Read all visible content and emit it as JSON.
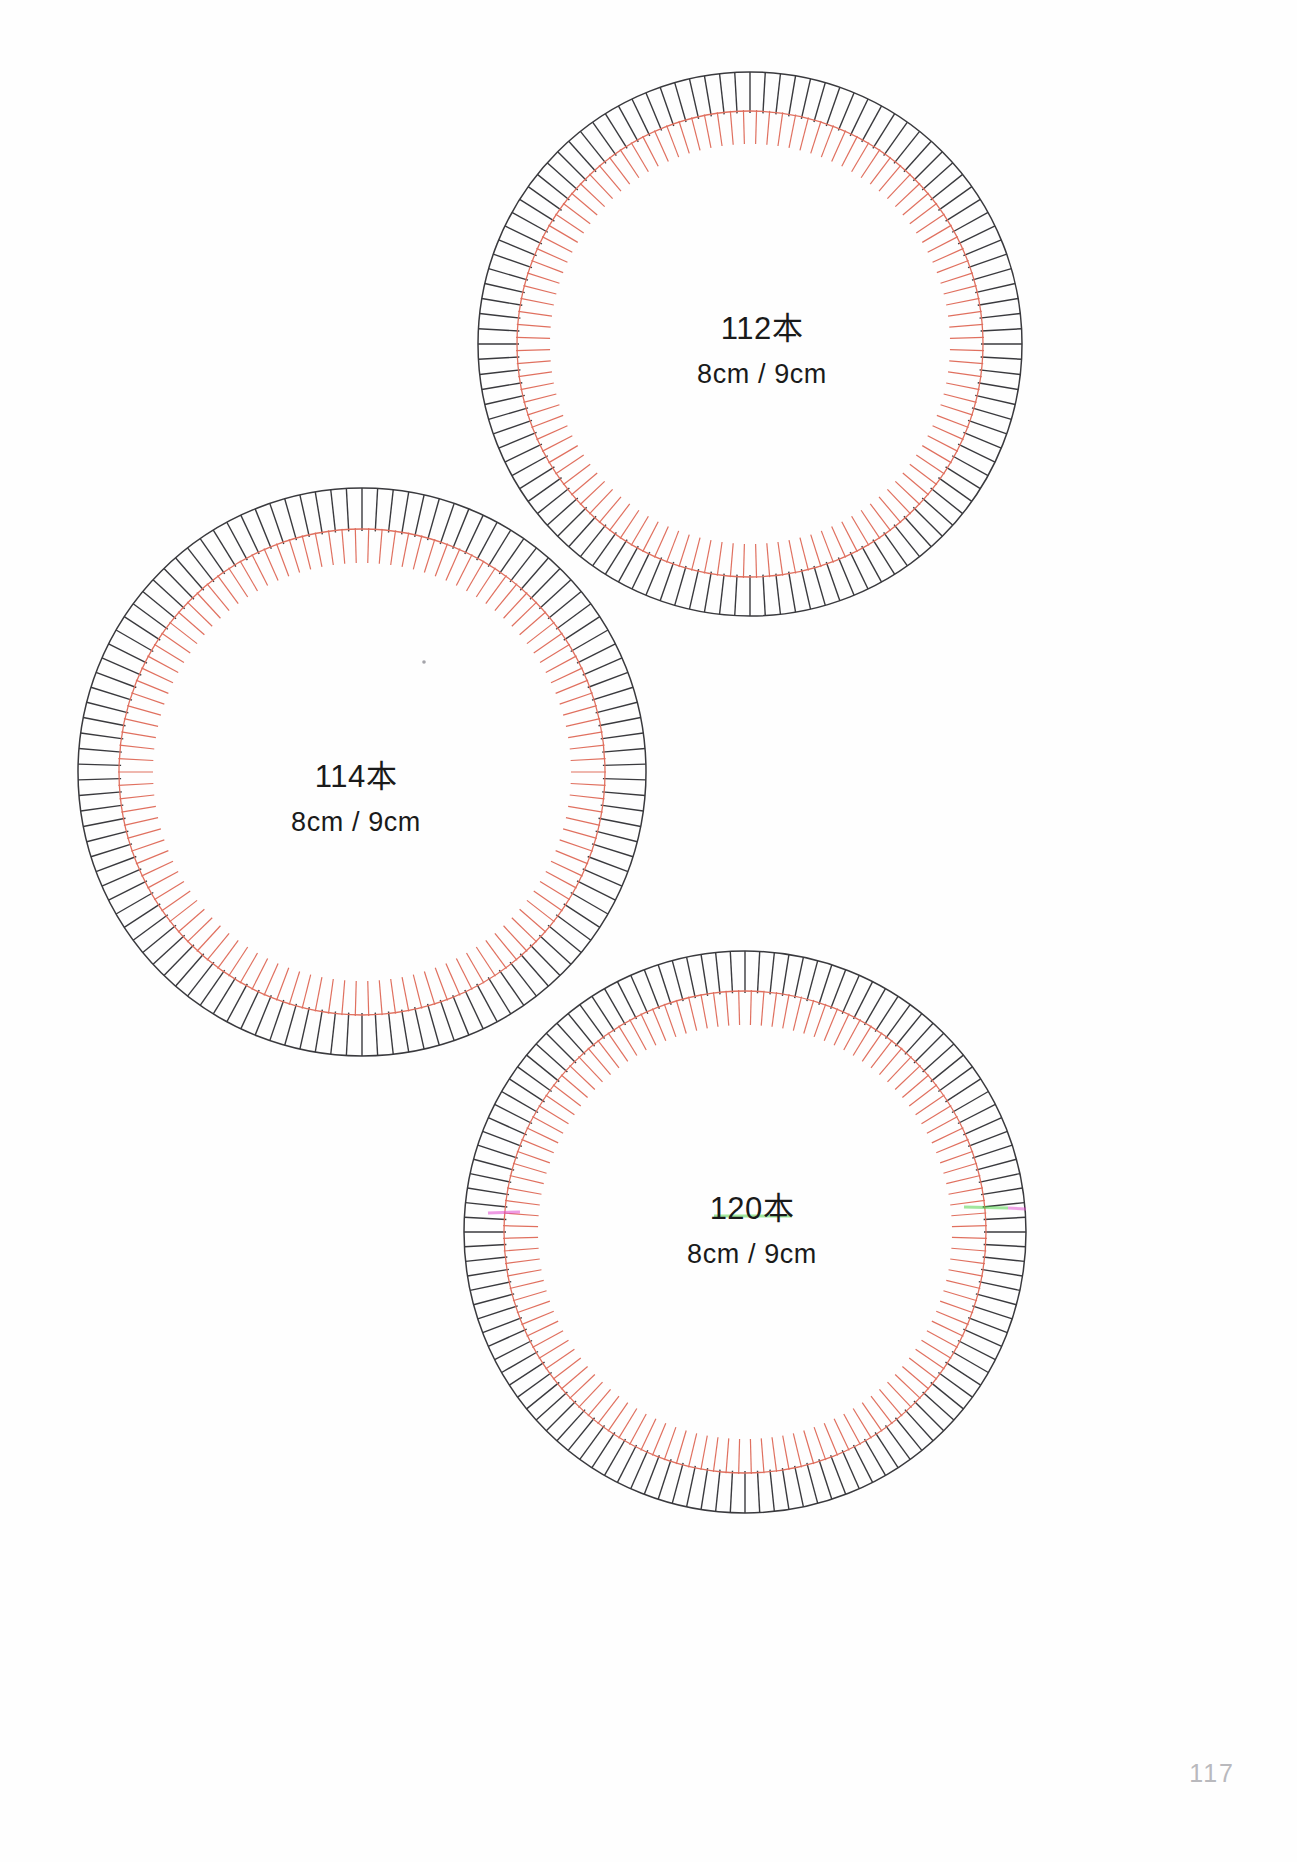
{
  "page": {
    "background_color": "#ffffff",
    "page_number": "117",
    "width": 1297,
    "height": 1862
  },
  "colors": {
    "outer_ring": "#3a3a3e",
    "inner_ring": "#e0705f",
    "text": "#1a1a1a",
    "page_number": "#b9b9bd",
    "artifact_magenta": "#e24bd0",
    "artifact_green": "#46d13f"
  },
  "wheels": [
    {
      "id": "wheel-112",
      "count_label": "112本",
      "size_label": "8cm / 9cm",
      "teeth": 112,
      "center_x": 750,
      "center_y": 344,
      "outer_radius": 272,
      "inner_radius": 233,
      "tick_inner_radius": 200,
      "label_x": 762,
      "label_y": 308,
      "artifacts": []
    },
    {
      "id": "wheel-114",
      "count_label": "114本",
      "size_label": "8cm / 9cm",
      "teeth": 114,
      "center_x": 362,
      "center_y": 772,
      "outer_radius": 284,
      "inner_radius": 243,
      "tick_inner_radius": 209,
      "label_x": 356,
      "label_y": 756,
      "artifacts": [
        {
          "x": 424,
          "y": 662,
          "type": "speck"
        }
      ]
    },
    {
      "id": "wheel-120",
      "count_label": "120本",
      "size_label": "8cm / 9cm",
      "teeth": 120,
      "center_x": 745,
      "center_y": 1232,
      "outer_radius": 281,
      "inner_radius": 241,
      "tick_inner_radius": 207,
      "label_x": 752,
      "label_y": 1188,
      "artifacts": [
        {
          "x": 504,
          "y": 1213,
          "type": "color-fringe-magenta"
        },
        {
          "x": 986,
          "y": 1207,
          "type": "color-fringe-green"
        }
      ]
    }
  ],
  "chart_data": {
    "type": "diagram",
    "items": [
      {
        "label": "112本",
        "teeth": 112,
        "size": "8cm / 9cm"
      },
      {
        "label": "114本",
        "teeth": 114,
        "size": "8cm / 9cm"
      },
      {
        "label": "120本",
        "teeth": 120,
        "size": "8cm / 9cm"
      }
    ]
  }
}
